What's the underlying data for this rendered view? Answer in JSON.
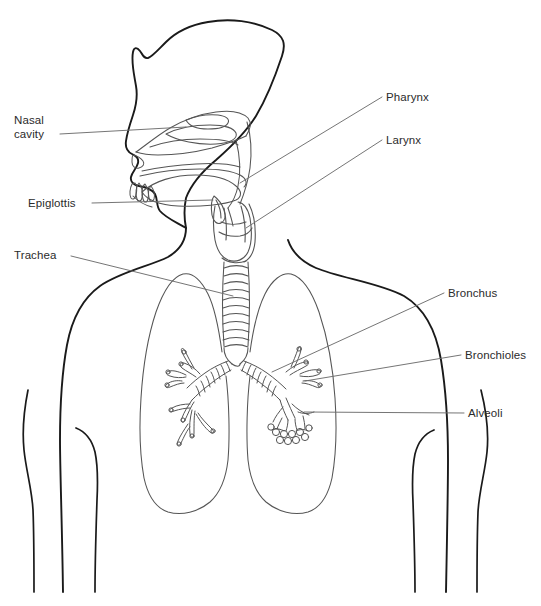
{
  "figure": {
    "kind": "anatomical-line-diagram",
    "background_color": "#ffffff",
    "stroke_color": "#1a1a1a",
    "detail_stroke_color": "#555555",
    "leader_color": "#6e6e6e",
    "text_color": "#2b2b2b"
  },
  "labels": [
    {
      "id": "nasal-cavity",
      "text_line1": "Nasal",
      "text_line2": "cavity",
      "side": "left",
      "text_x": 14,
      "text_y": 114,
      "leader": {
        "x1": 60,
        "y1": 134,
        "x2": 186,
        "y2": 127
      }
    },
    {
      "id": "epiglottis",
      "text_line1": "Epiglottis",
      "text_line2": "",
      "side": "left",
      "text_x": 28,
      "text_y": 197,
      "leader": {
        "x1": 92,
        "y1": 203,
        "x2": 213,
        "y2": 200
      }
    },
    {
      "id": "trachea",
      "text_line1": "Trachea",
      "text_line2": "",
      "side": "left",
      "text_x": 14,
      "text_y": 249,
      "leader": {
        "x1": 71,
        "y1": 256,
        "x2": 233,
        "y2": 296
      }
    },
    {
      "id": "pharynx",
      "text_line1": "Pharynx",
      "text_line2": "",
      "side": "right",
      "text_x": 386,
      "text_y": 91,
      "leader": {
        "x1": 382,
        "y1": 97,
        "x2": 240,
        "y2": 183
      }
    },
    {
      "id": "larynx",
      "text_line1": "Larynx",
      "text_line2": "",
      "side": "right",
      "text_x": 386,
      "text_y": 134,
      "leader": {
        "x1": 382,
        "y1": 140,
        "x2": 246,
        "y2": 228
      }
    },
    {
      "id": "bronchus",
      "text_line1": "Bronchus",
      "text_line2": "",
      "side": "right",
      "text_x": 448,
      "text_y": 287,
      "leader": {
        "x1": 444,
        "y1": 293,
        "x2": 272,
        "y2": 372
      }
    },
    {
      "id": "bronchioles",
      "text_line1": "Bronchioles",
      "text_line2": "",
      "side": "right",
      "text_x": 465,
      "text_y": 349,
      "leader": {
        "x1": 461,
        "y1": 355,
        "x2": 305,
        "y2": 381
      }
    },
    {
      "id": "alveoli",
      "text_line1": "Alveoli",
      "text_line2": "",
      "side": "right",
      "text_x": 468,
      "text_y": 407,
      "leader": {
        "x1": 464,
        "y1": 413,
        "x2": 304,
        "y2": 412
      }
    }
  ],
  "anatomy_parts": [
    "head-profile",
    "nasal-cavity-turbinates",
    "oral-cavity-tongue",
    "pharynx",
    "epiglottis",
    "larynx",
    "trachea-rings",
    "left-lung",
    "right-lung",
    "left-bronchus",
    "right-bronchus",
    "bronchioles",
    "alveoli-cluster",
    "torso-outline",
    "left-arm",
    "right-arm"
  ]
}
